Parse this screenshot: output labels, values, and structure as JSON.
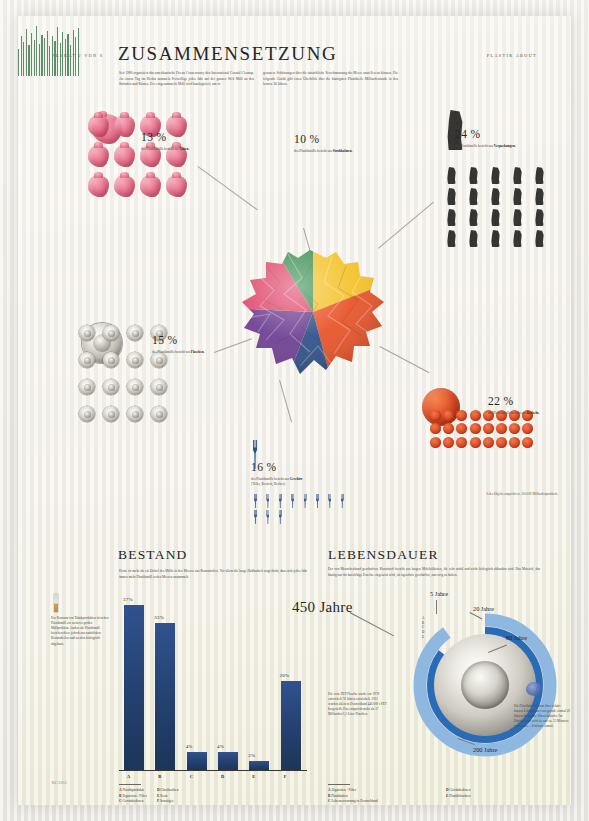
{
  "poster": {
    "runhead_left": "PLAKAT 2 VON 6",
    "runhead_right": "PLASTIK ABOUT",
    "credit": "KC/2015"
  },
  "sections": {
    "zusammensetzung": {
      "title": "ZUSAMMENSETZUNG",
      "deck_left": "Seit 1986 organisiert das amerikanische Ocean Conservancy den International Coastal Cleanup. An einem Tag im Herbst sammeln Freiwillige jedes Jahr auf der ganzen Welt Müll an den Stränden und Küsten. Der eingesammelte Müll wird katalogisiert, um so",
      "deck_right": "genauere Schätzungen über die tatsächliche Verschmutzung der Meere anstellen zu können. Die folgende Grafik gibt einen Überblick über die häufigsten Plastikteile Milliardenfunde in den letzten 30 Jahren.",
      "note_objects": "Jedes Objekt entspricht ca. 100.000 Milliardenpartikeln."
    },
    "bestand": {
      "title": "BESTAND",
      "deck": "Heute ist mehr als ein Drittel des Mülls in den Meeren aus Kunststoffen. Vor allem die lange Haltbarkeit sorgt dafür, dass sich jedes Jahr immer mehr Plastikmüll in den Meeren ansammelt.",
      "sidenote": "Der Konsum von Tabakprodukten ist neben Plastikmüll ein weiteres großes Müllproblem. Anders als Plastikmüll bestehen diese jedoch aus natürlichen Bestandteilen und werden biologisch abgebaut."
    },
    "lebensdauer": {
      "title": "LEBENSDAUER",
      "deck": "Der von Menschenhand geschaffene Kunststoff besteht aus langen Molekülketten, die sehr stabil und nicht biologisch abbaubar sind. Das Material, das häufig nur für kurzlebige Zwecke eingesetzt wird, ist irgendwie geschaffen, um ewig zu halten.",
      "note_pet": "Die erste PET-Flasche wurde vor 1978 entwickelt 76 Jahren entwickelt. 2011 wurden allein in Deutschland 440.000 t PET hergestellt. Das entspricht mehr als 17 Milliarden 0,5-Liter-Flaschen.",
      "note_micro": "Die Plastiktüte ist trotz ihrer relativ kurzen Lebensdauer von gerade einmal 20 Jahren der größte Umweltsünder. Im Durchschnitt wird sie nur ca. 25 Minuten verwendet. – Und nur einmal."
    }
  },
  "composition": [
    {
      "id": "tueten",
      "percent": "13 %",
      "caption_prefix": "des Plastikmülls besteht",
      "caption_suffix": "aus ",
      "material": "Tüten.",
      "color": "#d9486a",
      "share": 13
    },
    {
      "id": "strohhalme",
      "percent": "10 %",
      "caption_prefix": "des Plastikmülls besteht",
      "caption_suffix": "aus ",
      "material": "Strohhalmen.",
      "color": "#3f8f55",
      "share": 10
    },
    {
      "id": "verpackungen",
      "percent": "24 %",
      "caption_prefix": "des Plastikmülls besteht",
      "caption_suffix": "aus ",
      "material": "Verpackungen.",
      "color": "#f2c230",
      "share": 24
    },
    {
      "id": "deckel",
      "percent": "22 %",
      "caption_prefix": "des Plastikmülls besteht",
      "caption_suffix": "aus ",
      "material": "Deckeln.",
      "color": "#e2532b",
      "share": 22
    },
    {
      "id": "geschirr",
      "percent": "16 %",
      "caption_prefix": "des Plastikmülls besteht aus ",
      "caption_suffix": "",
      "material": "Geschirr",
      "material_sub": "(Teller, Besteck, Becher).",
      "color": "#2f4f86",
      "share": 16
    },
    {
      "id": "flaschen",
      "percent": "15 %",
      "caption_prefix": "des Plastikmülls besteht",
      "caption_suffix": "aus ",
      "material": "Flaschen.",
      "color": "#6b3f8e",
      "share": 15
    }
  ],
  "chart_data": [
    {
      "type": "bar",
      "title": "BESTAND",
      "categories": [
        "A",
        "B",
        "C",
        "D",
        "E",
        "F"
      ],
      "values": [
        37,
        33,
        4,
        4,
        2,
        20
      ],
      "value_labels": [
        "37%",
        "33%",
        "4%",
        "4%",
        "2%",
        "20%"
      ],
      "ylabel": "",
      "xlabel": "",
      "ylim": [
        0,
        40
      ],
      "grid": false,
      "color": "#24406f",
      "legend_position": "below",
      "legend": [
        {
          "key": "A",
          "label": "Plastikprodukte"
        },
        {
          "key": "B",
          "label": "Zigaretten / Filter"
        },
        {
          "key": "C",
          "label": "Getränkedosen"
        },
        {
          "key": "D",
          "label": "Glasflaschen"
        },
        {
          "key": "E",
          "label": "Reste"
        },
        {
          "key": "F",
          "label": "Sonstiges"
        }
      ]
    },
    {
      "type": "pie",
      "title": "ZUSAMMENSETZUNG",
      "categories": [
        "Verpackungen",
        "Deckel",
        "Geschirr",
        "Flaschen",
        "Tüten",
        "Strohhalme"
      ],
      "values": [
        24,
        22,
        16,
        15,
        13,
        10
      ],
      "colors": [
        "#f2c230",
        "#e2532b",
        "#2f4f86",
        "#6b3f8e",
        "#d9486a",
        "#3f8f55"
      ],
      "grid": false,
      "legend_position": "callouts"
    },
    {
      "type": "pie",
      "title": "LEBENSDAUER",
      "subtitle": "Lebensdauer in Jahren",
      "categories": [
        "Zigaretten / Filter",
        "Plastiktüten",
        "Lebenserwartung in Deutschland",
        "Getränkedosen",
        "Plastikflaschen"
      ],
      "values": [
        5,
        20,
        80,
        200,
        450
      ],
      "value_labels": [
        "5 Jahre",
        "20 Jahre",
        "80 Jahre",
        "200 Jahre",
        "450 Jahre"
      ],
      "colors": [
        "#1d3559",
        "#2f5d9e",
        "#5b8fcf",
        "#2a6bb5",
        "#8fb8e0"
      ],
      "grid": false,
      "legend_position": "below",
      "legend": [
        {
          "key": "A",
          "label": "Zigaretten / Filter"
        },
        {
          "key": "B",
          "label": "Plastiktüten"
        },
        {
          "key": "C",
          "label": "Lebenserwartung in Deutschland"
        },
        {
          "key": "D",
          "label": "Getränkedosen"
        },
        {
          "key": "E",
          "label": "Plastikflaschen"
        }
      ],
      "center_label": "450 Jahre"
    }
  ]
}
